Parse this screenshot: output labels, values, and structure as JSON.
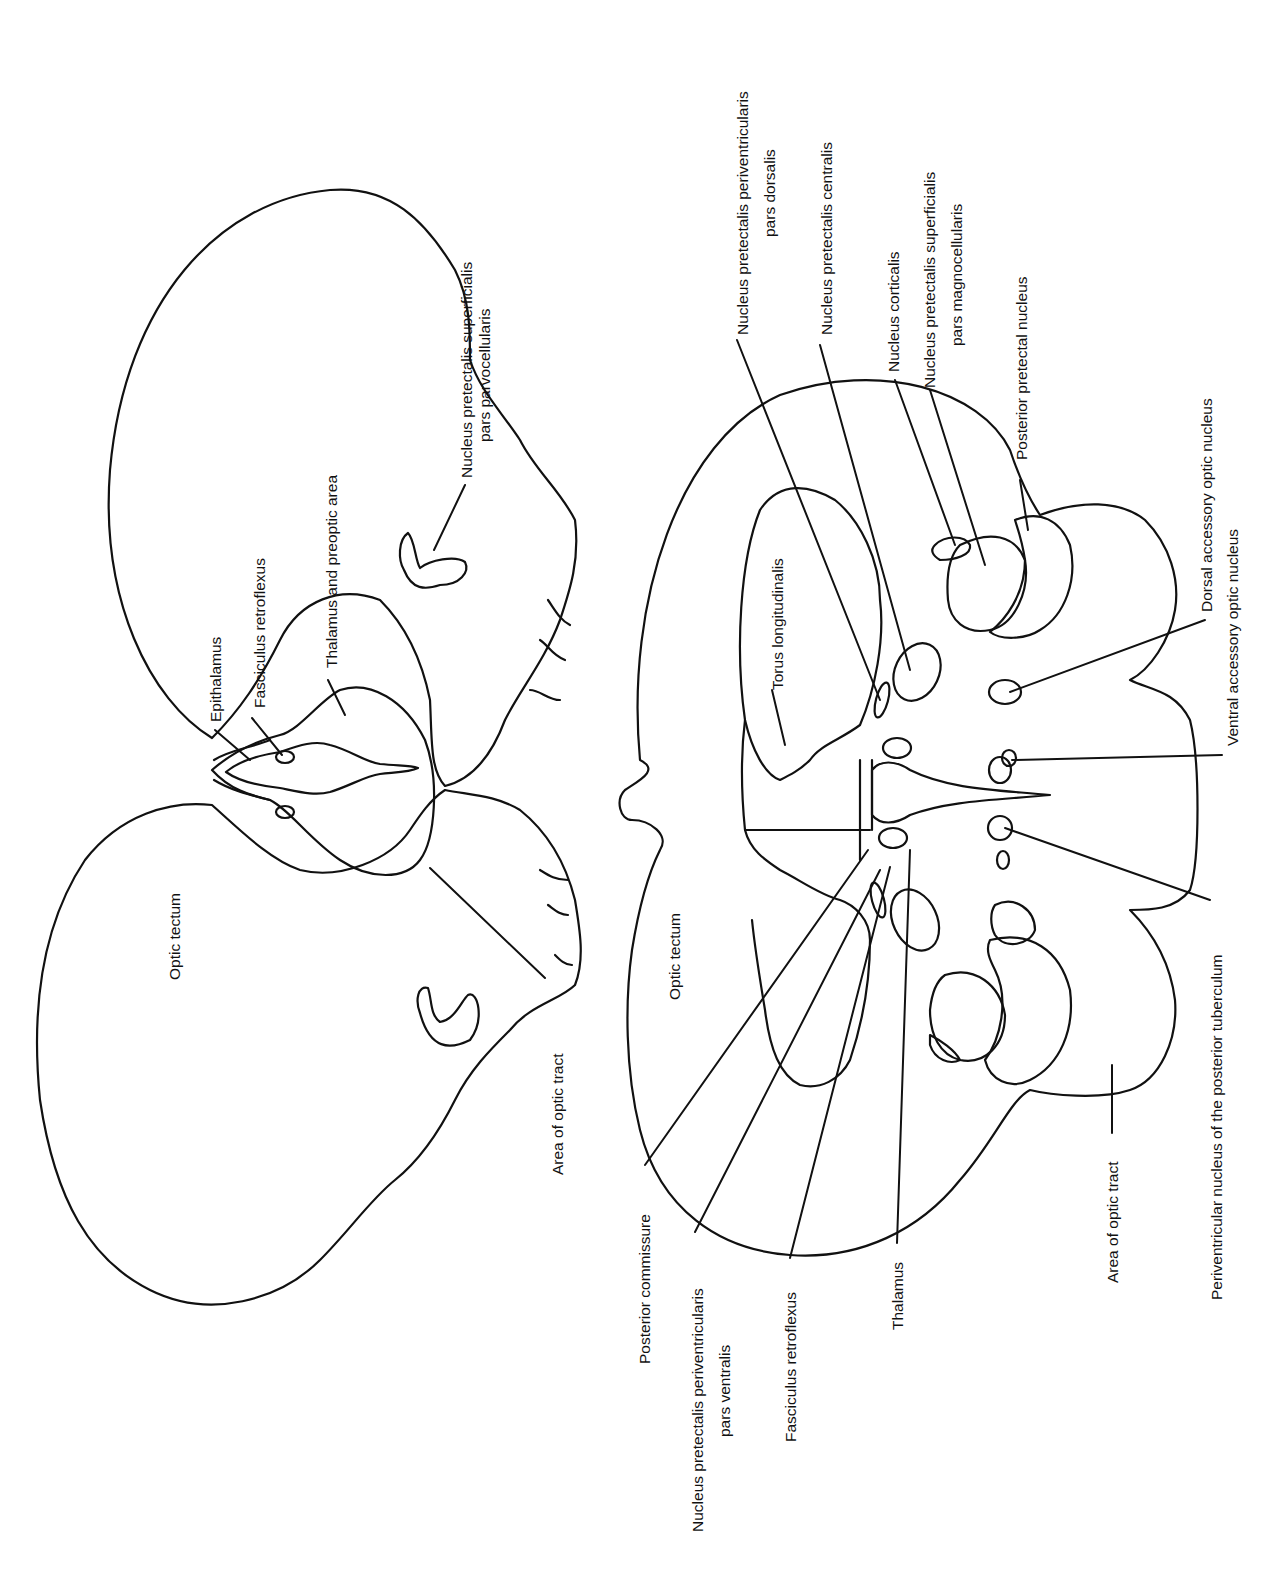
{
  "figure": {
    "colors": {
      "line": "#111111",
      "background": "#ffffff"
    }
  },
  "left_section": {
    "labels": {
      "optic_tectum": "Optic tectum",
      "area_of_optic_tract": "Area of optic tract",
      "epithalamus": "Epithalamus",
      "fasciculus_retroflexus": "Fasciculus retroflexus",
      "thalamus_preoptic": "Thalamus and preoptic area",
      "npsp_line1": "Nucleus pretectalis superficialis",
      "npsp_line2": "pars parvocellularis"
    }
  },
  "right_section": {
    "labels": {
      "optic_tectum": "Optic tectum",
      "torus_longitudinalis": "Torus longitudinalis",
      "nppd_line1": "Nucleus pretectalis periventricularis",
      "nppd_line2": "pars dorsalis",
      "npc": "Nucleus pretectalis centralis",
      "nucleus_corticalis": "Nucleus corticalis",
      "npsm_line1": "Nucleus pretectalis superficialis",
      "npsm_line2": "pars magnocellularis",
      "posterior_pretectal": "Posterior pretectal nucleus",
      "dorsal_accessory": "Dorsal accessory optic nucleus",
      "ventral_accessory": "Ventral accessory optic nucleus",
      "periventricular_pt": "Periventricular nucleus of the posterior tuberculum",
      "area_of_optic_tract": "Area of optic tract",
      "thalamus": "Thalamus",
      "fasciculus_retroflexus": "Fasciculus retroflexus",
      "nppv_line1": "Nucleus pretectalis periventricularis",
      "nppv_line2": "pars ventralis",
      "posterior_commissure": "Posterior commissure"
    }
  }
}
